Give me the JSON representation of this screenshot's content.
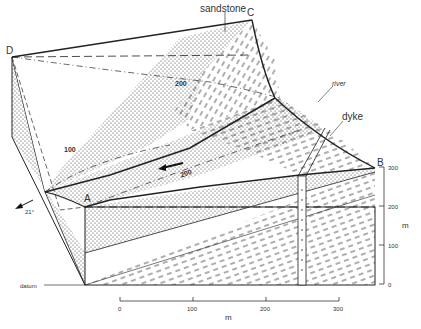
{
  "diagram": {
    "type": "geological block diagram",
    "corner_labels": {
      "A": "A",
      "B": "B",
      "C": "C",
      "D": "D"
    },
    "feature_labels": {
      "sandstone": "sandstone",
      "river": "river",
      "dyke": "dyke",
      "datum": "datum"
    },
    "contour_labels": [
      "200",
      "100",
      "200"
    ],
    "dip": {
      "value": "21°",
      "arrow": "dip-arrow"
    },
    "vertical_scale": {
      "unit": "m",
      "ticks": [
        "300",
        "200",
        "100",
        "0"
      ]
    },
    "horizontal_scale": {
      "unit": "m",
      "ticks": [
        "0",
        "100",
        "200",
        "300"
      ]
    },
    "colors": {
      "line": "#222222",
      "fill": "#ffffff",
      "text": "#333333"
    }
  }
}
